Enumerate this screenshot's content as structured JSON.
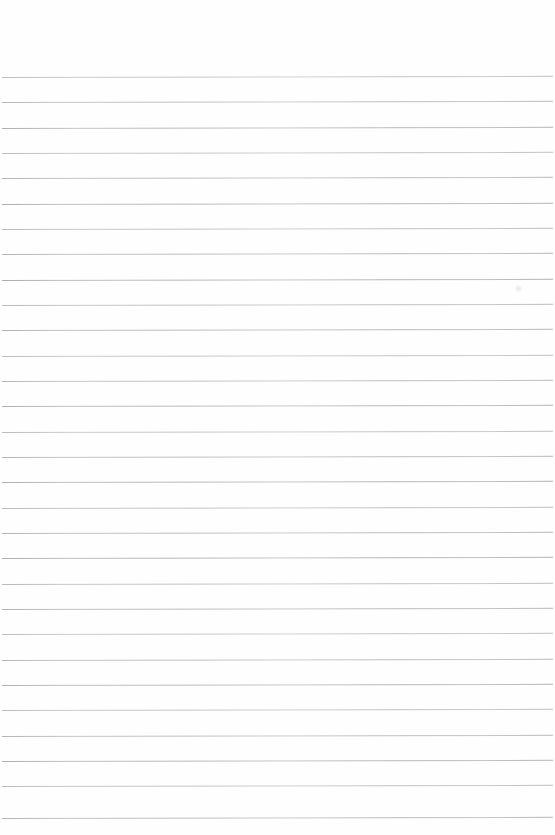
{
  "page": {
    "kind": "blank-lined-paper",
    "width_px": 555,
    "height_px": 835,
    "background_color": "#ffffff",
    "surface_color": "#fefefe",
    "content_text": ""
  },
  "ruling": {
    "line_color": "#b9bdc2",
    "line_thickness_px": 1,
    "line_count": 30,
    "first_line_y_px": 77,
    "line_spacing_px": 25.3,
    "left_margin_px": 2,
    "right_margin_px": 2,
    "tilt_deg": -0.12,
    "line_positions_px": [
      77,
      102,
      128,
      153,
      178,
      204,
      229,
      254,
      280,
      305,
      330,
      356,
      381,
      406,
      432,
      457,
      482,
      508,
      533,
      558,
      584,
      609,
      634,
      660,
      685,
      710,
      736,
      761,
      786,
      818
    ]
  },
  "margins": {
    "top_unruled_height_px": 77,
    "bottom_unruled_height_px": 17
  },
  "blemish": {
    "label": "paper-smudge",
    "x_px": 514,
    "y_px": 284,
    "size_px": 9,
    "color": "#969ba0"
  }
}
